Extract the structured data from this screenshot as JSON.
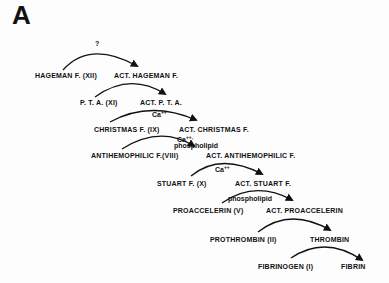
{
  "panel_label": "A",
  "steps": [
    {
      "factor": "HAGEMAN F. (XII)",
      "active": "ACT. HAGEMAN F.",
      "cofactor": "?"
    },
    {
      "factor": "P. T. A. (XI)",
      "active": "ACT. P. T. A.",
      "cofactor": ""
    },
    {
      "factor": "CHRISTMAS F. (IX)",
      "active": "ACT. CHRISTMAS F.",
      "cofactor": "Ca++"
    },
    {
      "factor": "ANTIHEMOPHILIC F.(VIII)",
      "active": "ACT. ANTIHEMOPHILIC F.",
      "cofactor": "Ca++, phospholipid"
    },
    {
      "factor": "STUART F. (X)",
      "active": "ACT. STUART F.",
      "cofactor": "Ca++"
    },
    {
      "factor": "PROACCELERIN (V)",
      "active": "ACT. PROACCELERIN",
      "cofactor": "phospholipid"
    },
    {
      "factor": "PROTHROMBIN (II)",
      "active": "THROMBIN",
      "cofactor": ""
    },
    {
      "factor": "FIBRINOGEN (I)",
      "active": "FIBRIN",
      "cofactor": ""
    }
  ],
  "cofactor_labels": {
    "q": "?",
    "ca1": "Ca",
    "ca1_sup": "++",
    "ca2": "Ca",
    "ca2_sup": "++,",
    "phospholipid1": "phospholipid",
    "ca3": "Ca",
    "ca3_sup": "++",
    "phospholipid2": "phospholipid"
  }
}
